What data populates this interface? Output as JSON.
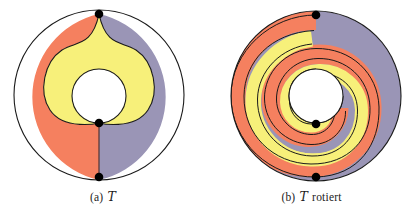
{
  "figure": {
    "background_color": "#ffffff",
    "width": 415,
    "height": 222,
    "palette": {
      "orange": "#F5805F",
      "yellow": "#F7F07A",
      "purple": "#9A95B6",
      "outline": "#1a1a1a",
      "dot": "#000000",
      "hole": "#ffffff"
    },
    "panels": [
      {
        "id": "a",
        "caption_prefix": "(a)",
        "caption_symbol": "T",
        "caption_suffix": "",
        "caption_full": "(a) T",
        "shape": "annulus-heart",
        "center_x": 99,
        "center_y": 95,
        "outer_radius": 85,
        "inner_radius": 27,
        "dots": [
          {
            "name": "top-vertex",
            "x": 99,
            "y": 14
          },
          {
            "name": "middle-vertex",
            "x": 99,
            "y": 123
          },
          {
            "name": "bottom-vertex",
            "x": 99,
            "y": 176
          }
        ],
        "regions": [
          {
            "name": "left-region",
            "color": "#F5805F"
          },
          {
            "name": "right-region",
            "color": "#9A95B6"
          },
          {
            "name": "center-region",
            "color": "#F7F07A"
          }
        ]
      },
      {
        "id": "b",
        "caption_prefix": "(b)",
        "caption_symbol": "T",
        "caption_suffix": "rotiert",
        "caption_full": "(b) T rotiert",
        "shape": "annulus-spiral",
        "center_x": 108,
        "center_y": 96,
        "outer_radius": 85,
        "inner_radius": 27,
        "dots": [
          {
            "name": "top-vertex",
            "x": 108,
            "y": 15
          },
          {
            "name": "middle-vertex",
            "x": 108,
            "y": 124
          },
          {
            "name": "bottom-vertex",
            "x": 108,
            "y": 177
          }
        ],
        "regions": [
          {
            "name": "spiral-band-purple",
            "color": "#9A95B6"
          },
          {
            "name": "spiral-band-orange",
            "color": "#F5805F"
          },
          {
            "name": "spiral-band-yellow",
            "color": "#F7F07A"
          }
        ]
      }
    ]
  }
}
